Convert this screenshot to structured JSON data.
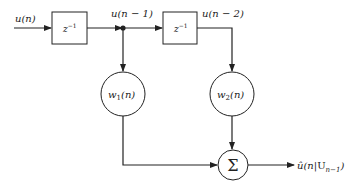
{
  "diagram": {
    "input_label": "u(n)",
    "delay1": {
      "label": "z",
      "exp": "−1"
    },
    "delay2": {
      "label": "z",
      "exp": "−1"
    },
    "tap1_label": "u(n − 1)",
    "tap2_label": "u(n − 2)",
    "weight1": {
      "name": "w",
      "sub": "1",
      "arg": "(n)"
    },
    "weight2": {
      "name": "w",
      "sub": "2",
      "arg": "(n)"
    },
    "sum_symbol": "Σ",
    "output_label": {
      "main": "û(n|",
      "script": "U",
      "sub": "n−1",
      "close": ")"
    }
  },
  "colors": {
    "stroke": "#222222",
    "background": "#ffffff"
  }
}
